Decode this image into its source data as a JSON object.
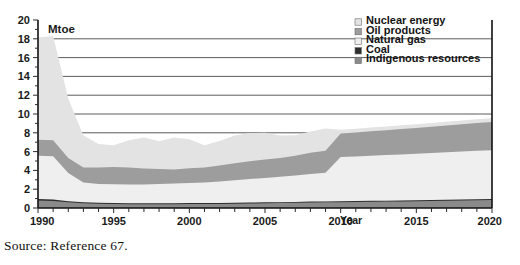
{
  "caption": "Source: Reference 67.",
  "unit_label": "Mtoe",
  "axis": {
    "x_title": "Year",
    "y_title": "Mtoe"
  },
  "legend": {
    "items": [
      {
        "label": "Nuclear energy",
        "color": "#e3e3e3"
      },
      {
        "label": "Oil products",
        "color": "#9d9d9d"
      },
      {
        "label": "Natural gas",
        "color": "#efefef"
      },
      {
        "label": "Coal",
        "color": "#2e2e2e"
      },
      {
        "label": "Indigenous resources",
        "color": "#8a8a8a"
      }
    ]
  },
  "chart_data": {
    "type": "area",
    "title": "",
    "subtitle": "",
    "xlabel": "Year",
    "ylabel": "Mtoe",
    "stacked": true,
    "grid": true,
    "legend_position": "top-right",
    "xlim": [
      1990,
      2020
    ],
    "ylim": [
      0,
      20
    ],
    "ytick_labels": [
      "0",
      "2",
      "4",
      "6",
      "8",
      "10",
      "12",
      "14",
      "16",
      "18",
      "20"
    ],
    "yticks": [
      0,
      2,
      4,
      6,
      8,
      10,
      12,
      14,
      16,
      18,
      20
    ],
    "xtick_labels": [
      "1990",
      "1995",
      "2000",
      "2005",
      "2010",
      "2015",
      "2020"
    ],
    "xticks": [
      1990,
      1995,
      2000,
      2005,
      2010,
      2015,
      2020
    ],
    "x": [
      1990,
      1991,
      1992,
      1993,
      1994,
      1995,
      1996,
      1997,
      1998,
      1999,
      2000,
      2001,
      2002,
      2003,
      2004,
      2005,
      2006,
      2007,
      2008,
      2009,
      2010,
      2011,
      2012,
      2013,
      2014,
      2015,
      2016,
      2017,
      2018,
      2019,
      2020
    ],
    "series": [
      {
        "name": "Indigenous resources",
        "color": "#8a8a8a",
        "values": [
          0.8,
          0.75,
          0.6,
          0.5,
          0.45,
          0.42,
          0.4,
          0.4,
          0.4,
          0.4,
          0.42,
          0.42,
          0.42,
          0.45,
          0.48,
          0.5,
          0.52,
          0.55,
          0.58,
          0.6,
          0.62,
          0.64,
          0.66,
          0.68,
          0.7,
          0.72,
          0.75,
          0.78,
          0.8,
          0.83,
          0.85
        ]
      },
      {
        "name": "Coal",
        "color": "#2e2e2e",
        "values": [
          0.15,
          0.15,
          0.12,
          0.1,
          0.1,
          0.1,
          0.1,
          0.1,
          0.1,
          0.1,
          0.1,
          0.1,
          0.1,
          0.1,
          0.1,
          0.1,
          0.1,
          0.1,
          0.1,
          0.1,
          0.1,
          0.1,
          0.1,
          0.1,
          0.1,
          0.1,
          0.1,
          0.1,
          0.1,
          0.1,
          0.1
        ]
      },
      {
        "name": "Natural gas",
        "color": "#efefef",
        "values": [
          4.6,
          4.6,
          3.0,
          2.1,
          2.0,
          2.0,
          2.0,
          2.0,
          2.05,
          2.1,
          2.15,
          2.2,
          2.3,
          2.4,
          2.5,
          2.6,
          2.7,
          2.8,
          2.95,
          3.05,
          4.7,
          4.75,
          4.8,
          4.85,
          4.9,
          4.95,
          5.0,
          5.05,
          5.1,
          5.15,
          5.2
        ]
      },
      {
        "name": "Oil products",
        "color": "#9d9d9d",
        "values": [
          1.7,
          1.7,
          1.6,
          1.6,
          1.75,
          1.85,
          1.8,
          1.7,
          1.6,
          1.5,
          1.55,
          1.6,
          1.7,
          1.8,
          1.9,
          1.95,
          2.0,
          2.1,
          2.25,
          2.35,
          2.5,
          2.55,
          2.6,
          2.65,
          2.7,
          2.75,
          2.8,
          2.85,
          2.9,
          2.95,
          3.0
        ]
      },
      {
        "name": "Nuclear energy",
        "color": "#e3e3e3",
        "values": [
          10.9,
          11.1,
          6.3,
          3.4,
          2.5,
          2.3,
          2.9,
          3.3,
          2.95,
          3.4,
          3.1,
          2.35,
          2.6,
          2.95,
          3.0,
          2.85,
          2.4,
          2.2,
          2.25,
          2.35,
          0.4,
          0.4,
          0.4,
          0.4,
          0.4,
          0.4,
          0.4,
          0.4,
          0.4,
          0.4,
          0.4
        ]
      }
    ],
    "totals": [
      18.15,
      18.3,
      11.62,
      7.7,
      6.8,
      6.67,
      7.2,
      7.5,
      7.1,
      7.45,
      7.32,
      6.67,
      7.12,
      7.7,
      7.98,
      8.0,
      7.72,
      7.75,
      8.13,
      8.45,
      8.32,
      8.44,
      8.56,
      8.68,
      8.8,
      8.92,
      9.05,
      9.18,
      9.3,
      9.43,
      9.55
    ]
  }
}
